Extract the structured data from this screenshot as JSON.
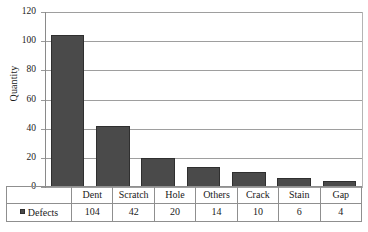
{
  "chart_data": {
    "type": "bar",
    "title": "",
    "xlabel": "",
    "ylabel": "Quantity",
    "categories": [
      "Dent",
      "Scratch",
      "Hole",
      "Others",
      "Crack",
      "Stain",
      "Gap"
    ],
    "values": [
      104,
      42,
      20,
      14,
      10,
      6,
      4
    ],
    "series": [
      {
        "name": "Defects",
        "values": [
          104,
          42,
          20,
          14,
          10,
          6,
          4
        ]
      }
    ],
    "ylim": [
      0,
      120
    ],
    "ytick_step": 20,
    "ytick_labels": [
      "120",
      "100",
      "80",
      "60",
      "40",
      "20",
      "0"
    ],
    "grid": true,
    "legend_position": "data-table",
    "bar_color": "#4a4a4a",
    "bar_edge_color": "#2f2f2f",
    "gridline_color": "#9e9e9e",
    "data_table_visible": true,
    "data_table_row_label": "Defects"
  }
}
